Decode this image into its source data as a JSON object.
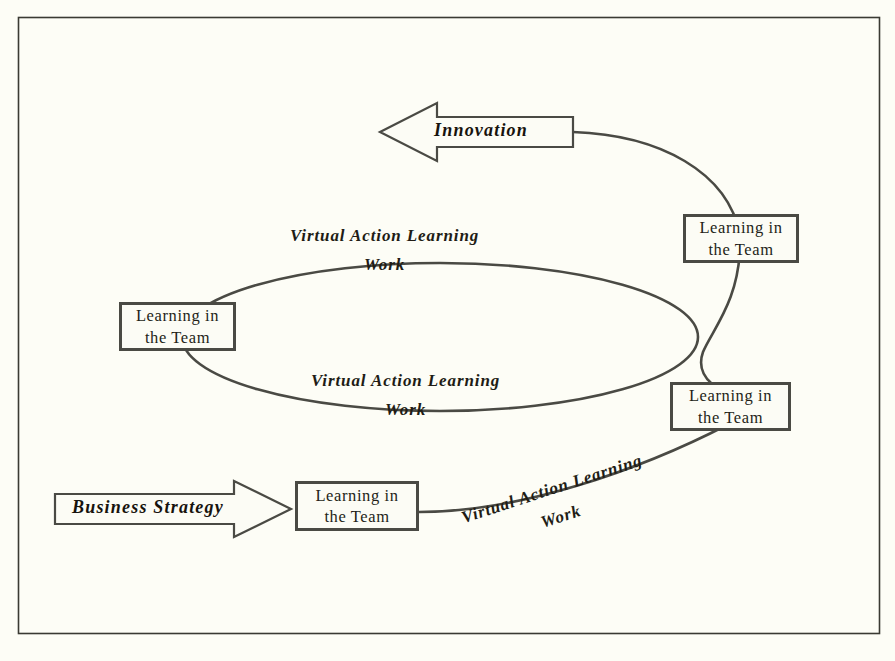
{
  "diagram": {
    "background_color": "#fdfdf6",
    "line_color": "#4a4a44",
    "text_color": "#211c15",
    "frame": {
      "x": 18,
      "y": 17,
      "width": 862,
      "height": 617
    },
    "nodes": [
      {
        "id": "team-top-right",
        "line1": "Learning in",
        "line2": "the Team",
        "x": 683,
        "y": 214,
        "width": 116,
        "height": 49
      },
      {
        "id": "team-left",
        "line1": "Learning in",
        "line2": "the Team",
        "x": 119,
        "y": 302,
        "width": 117,
        "height": 49
      },
      {
        "id": "team-bottom-right",
        "line1": "Learning in",
        "line2": "the Team",
        "x": 670,
        "y": 382,
        "width": 121,
        "height": 49
      },
      {
        "id": "team-bottom-left",
        "line1": "Learning in",
        "line2": "the Team",
        "x": 295,
        "y": 481,
        "width": 124,
        "height": 50
      }
    ],
    "arrows": [
      {
        "id": "innovation",
        "label": "Innovation",
        "direction": "left",
        "x": 380,
        "y": 103,
        "width": 193,
        "height": 59
      },
      {
        "id": "business-strategy",
        "label": "Business Strategy",
        "direction": "right",
        "x": 55,
        "y": 481,
        "width": 236,
        "height": 56
      }
    ],
    "curve_labels": [
      {
        "id": "upper-ellipse-label",
        "line1": "Virtual Action Learning",
        "line2": "Work",
        "x": 290,
        "y": 226,
        "rotation": 0
      },
      {
        "id": "lower-ellipse-label",
        "line1": "Virtual Action Learning",
        "line2": "Work",
        "x": 311,
        "y": 371,
        "rotation": 0
      },
      {
        "id": "bottom-curve-label",
        "line1": "Virtual Action Learning",
        "line2": "Work",
        "x": 459,
        "y": 509,
        "rotation": -18
      }
    ]
  }
}
